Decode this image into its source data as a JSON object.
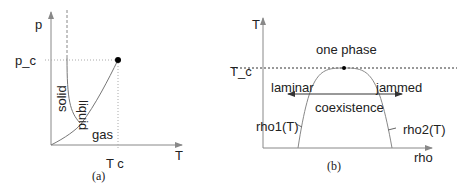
{
  "panel_a": {
    "caption": "(a)",
    "y_axis_label": "p",
    "x_axis_label": "T",
    "critical_pressure_label": "p_c",
    "critical_temp_label": "T c",
    "regions": {
      "solid": "solid",
      "liquid": "liquid",
      "gas": "gas"
    }
  },
  "panel_b": {
    "caption": "(b)",
    "y_axis_label": "T",
    "x_axis_label": "rho",
    "critical_temp_label": "T_c",
    "regions": {
      "one_phase": "one phase",
      "coexistence": "coexistence"
    },
    "arrow_labels": {
      "left": "laminar",
      "right": "jammed"
    },
    "curve_labels": {
      "left": "rho1(T)",
      "right": "rho2(T)"
    }
  },
  "colors": {
    "axis": "#888888",
    "curve": "#777777",
    "text": "#222222",
    "point": "#000000"
  }
}
